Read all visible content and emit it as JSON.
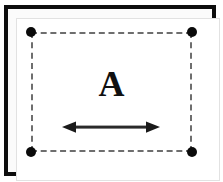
{
  "figure": {
    "label": "A",
    "background_color": "#ffffff"
  },
  "frame": {
    "name": "outer-frame",
    "stroke_color": "#0d0d0d",
    "stroke_width_px": 4,
    "fill_color": "#fbfbfb",
    "liner_color": "#e2e2e2"
  },
  "dashed_region": {
    "name": "dashed-boundary",
    "stroke_color": "#6e6e6e",
    "stroke_width_px": 2,
    "dash_style": "dashed",
    "corner_dot_color": "#0a0a0a",
    "corner_dot_diameter_px": 10,
    "corners": [
      {
        "name": "top-left",
        "x": 31,
        "y": 32
      },
      {
        "name": "top-right",
        "x": 192,
        "y": 32
      },
      {
        "name": "bottom-left",
        "x": 31,
        "y": 152
      },
      {
        "name": "bottom-right",
        "x": 192,
        "y": 152
      }
    ]
  },
  "arrow": {
    "name": "horizontal-double-arrow",
    "color": "#1a1a1a",
    "shaft_thickness_px": 3,
    "direction": "both",
    "start_x": 62,
    "end_x": 160,
    "y": 127
  }
}
